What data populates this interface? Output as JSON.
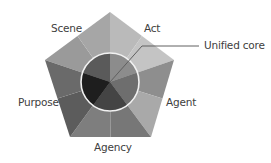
{
  "diagram": {
    "labels": {
      "scene": "Scene",
      "act": "Act",
      "agent": "Agent",
      "agency": "Agency",
      "purpose": "Purpose",
      "core": "Unified core"
    },
    "faces": [
      {
        "name": "Scene",
        "outer_light": "#a6a6a6",
        "outer_dark": "#9a9a9a",
        "inner": "#5a5a5a"
      },
      {
        "name": "Act",
        "outer_light": "#c4c4c4",
        "outer_dark": "#bababa",
        "inner": "#8c8c8c"
      },
      {
        "name": "Agent",
        "outer_light": "#a9a9a9",
        "outer_dark": "#8e8e8e",
        "inner": "#6e6e6e"
      },
      {
        "name": "Agency",
        "outer_light": "#7e7e7e",
        "outer_dark": "#777777",
        "inner": "#444444"
      },
      {
        "name": "Purpose",
        "outer_light": "#6a6a6a",
        "outer_dark": "#5c5c5c",
        "inner": "#1e1e1e"
      }
    ],
    "circle_stroke": "#f2f2f2",
    "pointer_color": "#606060"
  }
}
